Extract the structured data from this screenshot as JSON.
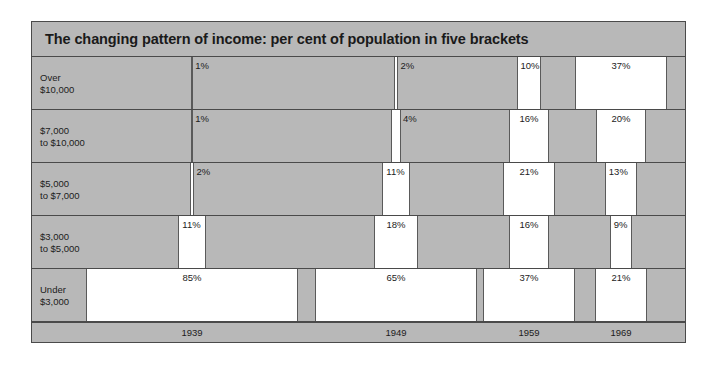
{
  "chart": {
    "title": "The changing pattern of income: per cent of population in five brackets"
  },
  "chart_data": {
    "type": "bar",
    "title": "The changing pattern of income: per cent of population in five brackets",
    "subtitle": "",
    "xlabel": "",
    "ylabel": "",
    "orientation": "horizontal",
    "grid": false,
    "legend": "none",
    "unit": "per cent of population",
    "categories": [
      "Over $10,000",
      "$7,000 to $10,000",
      "$5,000 to $7,000",
      "$3,000 to $5,000",
      "Under $3,000"
    ],
    "x": [
      "1939",
      "1949",
      "1959",
      "1969"
    ],
    "xlim": [
      0,
      100
    ],
    "series": [
      {
        "name": "1939",
        "values": [
          1,
          1,
          2,
          11,
          85
        ]
      },
      {
        "name": "1949",
        "values": [
          2,
          4,
          11,
          18,
          65
        ]
      },
      {
        "name": "1959",
        "values": [
          10,
          16,
          21,
          16,
          37
        ]
      },
      {
        "name": "1969",
        "values": [
          37,
          20,
          13,
          9,
          21
        ]
      }
    ]
  },
  "rows": [
    {
      "label": "Over\n$10,000",
      "name": "over-10000",
      "cells": [
        {
          "year": "1939",
          "value": 1,
          "display": "1%"
        },
        {
          "year": "1949",
          "value": 2,
          "display": "2%"
        },
        {
          "year": "1959",
          "value": 10,
          "display": "10%"
        },
        {
          "year": "1969",
          "value": 37,
          "display": "37%"
        }
      ]
    },
    {
      "label": "$7,000\nto $10,000",
      "name": "7000-to-10000",
      "cells": [
        {
          "year": "1939",
          "value": 1,
          "display": "1%"
        },
        {
          "year": "1949",
          "value": 4,
          "display": "4%"
        },
        {
          "year": "1959",
          "value": 16,
          "display": "16%"
        },
        {
          "year": "1969",
          "value": 20,
          "display": "20%"
        }
      ]
    },
    {
      "label": "$5,000\nto $7,000",
      "name": "5000-to-7000",
      "cells": [
        {
          "year": "1939",
          "value": 2,
          "display": "2%"
        },
        {
          "year": "1949",
          "value": 11,
          "display": "11%"
        },
        {
          "year": "1959",
          "value": 21,
          "display": "21%"
        },
        {
          "year": "1969",
          "value": 13,
          "display": "13%"
        }
      ]
    },
    {
      "label": "$3,000\nto $5,000",
      "name": "3000-to-5000",
      "cells": [
        {
          "year": "1939",
          "value": 11,
          "display": "11%"
        },
        {
          "year": "1949",
          "value": 18,
          "display": "18%"
        },
        {
          "year": "1959",
          "value": 16,
          "display": "16%"
        },
        {
          "year": "1969",
          "value": 9,
          "display": "9%"
        }
      ]
    },
    {
      "label": "Under\n$3,000",
      "name": "under-3000",
      "cells": [
        {
          "year": "1939",
          "value": 85,
          "display": "85%"
        },
        {
          "year": "1949",
          "value": 65,
          "display": "65%"
        },
        {
          "year": "1959",
          "value": 37,
          "display": "37%"
        },
        {
          "year": "1969",
          "value": 21,
          "display": "21%"
        }
      ]
    }
  ],
  "axis": {
    "years": [
      "1939",
      "1949",
      "1959",
      "1969"
    ]
  },
  "colors": {
    "panel_background": "#b8b8b8",
    "bar_fill": "#ffffff",
    "rule": "#4a4a4a",
    "text": "#1c1c1c"
  }
}
